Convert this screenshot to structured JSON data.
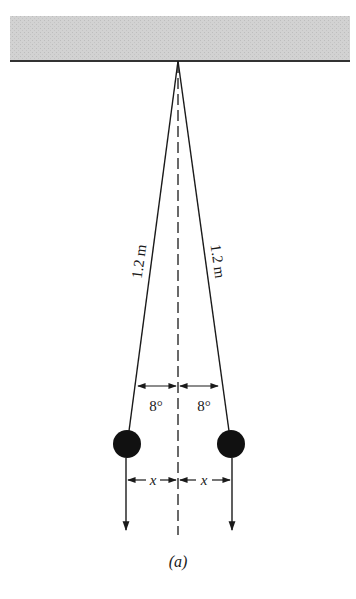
{
  "figure": {
    "caption": "(a)",
    "string_length_left": "1.2 m",
    "string_length_right": "1.2 m",
    "angle_left": "8°",
    "angle_right": "8°",
    "displacement_left": "x",
    "displacement_right": "x"
  },
  "colors": {
    "ceiling_fill": "#cfcfcf",
    "ceiling_edge": "#333333",
    "line": "#1a1a1a",
    "ball": "#111111"
  },
  "geometry": {
    "apex": [
      178,
      61
    ],
    "ball_left": [
      127,
      444
    ],
    "ball_right": [
      231,
      444
    ],
    "ball_radius": 14
  }
}
